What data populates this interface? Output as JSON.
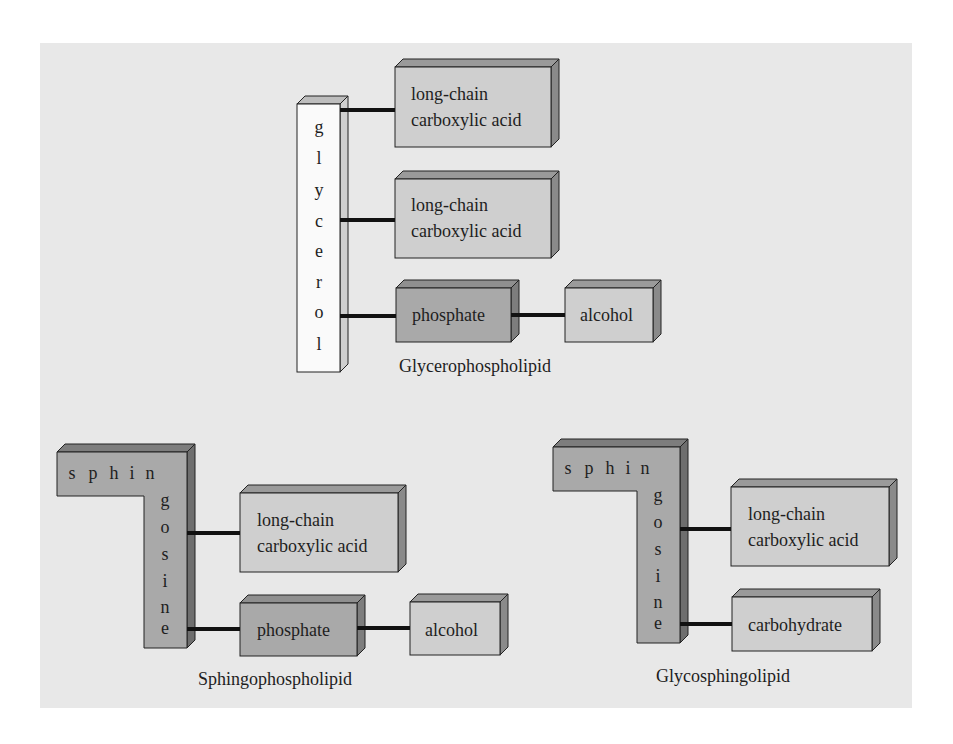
{
  "diagram": {
    "colors": {
      "background": "#e8e8e8",
      "box_light": "#cfcfcf",
      "box_dark": "#a9a9a9",
      "side_face": "#8a8a8a",
      "top_face": "#9a9a9a",
      "glycerol": "#fafafa",
      "connector": "#111111"
    },
    "glycerophospholipid": {
      "backbone_letters": [
        "g",
        "l",
        "y",
        "c",
        "e",
        "r",
        "o",
        "l"
      ],
      "fatty_acid_1": [
        "long-chain",
        "carboxylic acid"
      ],
      "fatty_acid_2": [
        "long-chain",
        "carboxylic acid"
      ],
      "phosphate": "phosphate",
      "alcohol": "alcohol",
      "caption": "Glycerophospholipid"
    },
    "sphingophospholipid": {
      "backbone_horizontal": [
        "s",
        "p",
        "h",
        "i",
        "n"
      ],
      "backbone_vertical": [
        "g",
        "o",
        "s",
        "i",
        "n",
        "e"
      ],
      "fatty_acid": [
        "long-chain",
        "carboxylic acid"
      ],
      "phosphate": "phosphate",
      "alcohol": "alcohol",
      "caption": "Sphingophospholipid"
    },
    "glycosphingolipid": {
      "backbone_horizontal": [
        "s",
        "p",
        "h",
        "i",
        "n"
      ],
      "backbone_vertical": [
        "g",
        "o",
        "s",
        "i",
        "n",
        "e"
      ],
      "fatty_acid": [
        "long-chain",
        "carboxylic acid"
      ],
      "carbohydrate": "carbohydrate",
      "caption": "Glycosphingolipid"
    }
  }
}
